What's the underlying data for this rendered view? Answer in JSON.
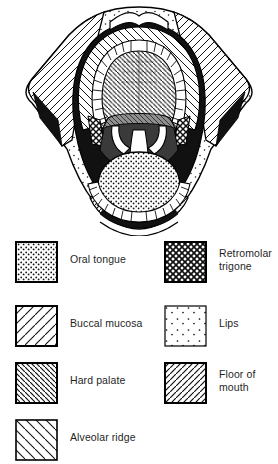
{
  "figure": {
    "view": "open mouth, anterior view"
  },
  "diagram": {
    "name": "oral-cavity-illustration",
    "structures": [
      {
        "id": "upper-lip",
        "label": "Lips",
        "pattern": "sparse-dots"
      },
      {
        "id": "lower-lip",
        "label": "Lips",
        "pattern": "sparse-dots"
      },
      {
        "id": "hard-palate",
        "label": "Hard palate",
        "pattern": "dense-hatch-backslash"
      },
      {
        "id": "soft-palate",
        "label": "Soft palate",
        "pattern": "cross-hatch"
      },
      {
        "id": "upper-alveolus",
        "label": "Alveolar ridge",
        "pattern": "hatch-backslash"
      },
      {
        "id": "lower-alveolus",
        "label": "Alveolar ridge",
        "pattern": "hatch-backslash"
      },
      {
        "id": "left-buccal",
        "label": "Buccal mucosa",
        "pattern": "hatch-slash"
      },
      {
        "id": "right-buccal",
        "label": "Buccal mucosa",
        "pattern": "hatch-slash"
      },
      {
        "id": "retromolar-left",
        "label": "Retromolar trigone",
        "pattern": "cross-hatch"
      },
      {
        "id": "retromolar-right",
        "label": "Retromolar trigone",
        "pattern": "cross-hatch"
      },
      {
        "id": "oral-tongue",
        "label": "Oral tongue",
        "pattern": "dense-dots"
      },
      {
        "id": "floor-of-mouth",
        "label": "Floor of mouth",
        "pattern": "dense-hatch-slash"
      },
      {
        "id": "upper-teeth",
        "label": "Upper teeth",
        "pattern": "outline"
      },
      {
        "id": "lower-teeth",
        "label": "Lower teeth",
        "pattern": "outline"
      },
      {
        "id": "uvula",
        "label": "Uvula",
        "pattern": "outline"
      }
    ]
  },
  "legend": {
    "items": [
      {
        "id": "oral-tongue",
        "label": "Oral tongue",
        "pattern": "dense-dots",
        "column": "left",
        "row": 1
      },
      {
        "id": "retromolar-trigone",
        "label": "Retromolar\ntrigone",
        "pattern": "cross-hatch",
        "column": "right",
        "row": 1
      },
      {
        "id": "buccal-mucosa",
        "label": "Buccal mucosa",
        "pattern": "hatch-slash",
        "column": "left",
        "row": 2
      },
      {
        "id": "lips",
        "label": "Lips",
        "pattern": "sparse-dots",
        "column": "right",
        "row": 2
      },
      {
        "id": "hard-palate",
        "label": "Hard palate",
        "pattern": "dense-hatch-backslash",
        "column": "left",
        "row": 3
      },
      {
        "id": "floor-of-mouth",
        "label": "Floor of\nmouth",
        "pattern": "dense-hatch-slash",
        "column": "right",
        "row": 3
      },
      {
        "id": "alveolar-ridge",
        "label": "Alveolar ridge",
        "pattern": "hatch-backslash",
        "column": "left",
        "row": 4
      }
    ]
  },
  "colors": {
    "ink": "#1a1a1a",
    "line": "#000000",
    "background": "#ffffff",
    "text": "#1f1f1f"
  }
}
